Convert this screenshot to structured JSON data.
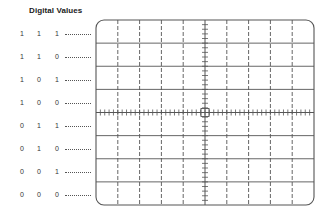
{
  "title": "Digital Values",
  "rows": [
    {
      "bits": [
        "1",
        "1",
        "1"
      ]
    },
    {
      "bits": [
        "1",
        "1",
        "0"
      ]
    },
    {
      "bits": [
        "1",
        "0",
        "1"
      ]
    },
    {
      "bits": [
        "1",
        "0",
        "0"
      ]
    },
    {
      "bits": [
        "0",
        "1",
        "1"
      ]
    },
    {
      "bits": [
        "0",
        "1",
        "0"
      ]
    },
    {
      "bits": [
        "0",
        "0",
        "1"
      ]
    },
    {
      "bits": [
        "0",
        "0",
        "0"
      ]
    }
  ],
  "graticule": {
    "horizontal_divisions": 10,
    "vertical_divisions": 8,
    "minor_ticks_per_division": 5,
    "line_color": "#555555",
    "dashed_vertical_lines": true,
    "solid_horizontal_lines": true,
    "center_marker": "small-square"
  }
}
